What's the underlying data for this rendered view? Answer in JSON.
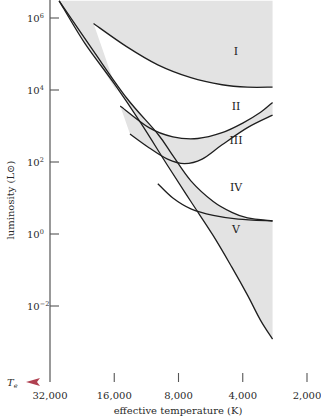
{
  "chart_data": {
    "type": "area",
    "title": "",
    "xlabel": "effective temperature (K)",
    "ylabel": "luminosity (L⊙)",
    "x_axis_symbol": "T",
    "x_axis_symbol_subscript": "e",
    "x_scale": "log",
    "x_reversed": true,
    "y_scale": "log",
    "xlim": [
      32000,
      2000
    ],
    "ylim": [
      0.001,
      10000000
    ],
    "grid": false,
    "x_ticks": [
      {
        "value": 32000,
        "label": "32,000"
      },
      {
        "value": 16000,
        "label": "16,000"
      },
      {
        "value": 8000,
        "label": "8,000"
      },
      {
        "value": 4000,
        "label": "4,000"
      },
      {
        "value": 2000,
        "label": "2,000"
      }
    ],
    "y_ticks": [
      {
        "value": 1000000,
        "base": "10",
        "exp": "6"
      },
      {
        "value": 10000,
        "base": "10",
        "exp": "4"
      },
      {
        "value": 100,
        "base": "10",
        "exp": "2"
      },
      {
        "value": 1,
        "base": "10",
        "exp": "0"
      },
      {
        "value": 0.01,
        "base": "10",
        "exp": "−2"
      }
    ],
    "x_axis_gradient": [
      "#d9667a",
      "#c9c27a",
      "#66c266",
      "#7a6a8a"
    ],
    "shaded_region": {
      "color": "#e3e3e3",
      "upper_luminosity": 3000000,
      "right_temperature": 2900
    },
    "series": [
      {
        "name": "main-sequence-upper-boundary",
        "points": [
          [
            29000,
            3000000
          ],
          [
            20000,
            120000
          ],
          [
            14000,
            6000
          ],
          [
            10000,
            600
          ],
          [
            8500,
            150
          ],
          [
            7000,
            30
          ],
          [
            5500,
            8
          ],
          [
            4500,
            4
          ],
          [
            3800,
            2.8
          ],
          [
            2900,
            2.3
          ]
        ]
      },
      {
        "name": "main-sequence-lower-boundary",
        "points": [
          [
            29000,
            3000000
          ],
          [
            22000,
            200000
          ],
          [
            16000,
            15000
          ],
          [
            12000,
            1200
          ],
          [
            9000,
            80
          ],
          [
            7000,
            8
          ],
          [
            5500,
            0.9
          ],
          [
            4500,
            0.12
          ],
          [
            3800,
            0.02
          ],
          [
            3300,
            0.004
          ],
          [
            2900,
            0.0012
          ]
        ]
      },
      {
        "name": "class-I-lower-boundary",
        "points": [
          [
            20000,
            700000
          ],
          [
            14000,
            160000
          ],
          [
            10000,
            50000
          ],
          [
            7000,
            22000
          ],
          [
            5000,
            14000
          ],
          [
            3800,
            12000
          ],
          [
            2900,
            12000
          ]
        ]
      },
      {
        "name": "class-II-lower-boundary",
        "points": [
          [
            15000,
            3600
          ],
          [
            11000,
            900
          ],
          [
            8500,
            500
          ],
          [
            6500,
            450
          ],
          [
            5000,
            650
          ],
          [
            4000,
            1200
          ],
          [
            3300,
            2400
          ],
          [
            2900,
            4500
          ]
        ]
      },
      {
        "name": "class-III-lower-boundary",
        "points": [
          [
            13500,
            600
          ],
          [
            11000,
            250
          ],
          [
            9000,
            120
          ],
          [
            7500,
            90
          ],
          [
            6200,
            120
          ],
          [
            5000,
            300
          ],
          [
            3800,
            900
          ],
          [
            2900,
            2000
          ]
        ]
      },
      {
        "name": "class-IV-lower-boundary",
        "points": [
          [
            10000,
            25
          ],
          [
            8500,
            10
          ],
          [
            7000,
            5
          ],
          [
            5500,
            3.3
          ],
          [
            4200,
            2.6
          ],
          [
            2900,
            2.3
          ]
        ]
      }
    ],
    "annotations": [
      {
        "label": "I",
        "temperature": 4300,
        "luminosity": 120000
      },
      {
        "label": "II",
        "temperature": 4300,
        "luminosity": 3600
      },
      {
        "label": "III",
        "temperature": 4300,
        "luminosity": 400
      },
      {
        "label": "IV",
        "temperature": 4300,
        "luminosity": 20
      },
      {
        "label": "V",
        "temperature": 4300,
        "luminosity": 1.4
      }
    ]
  }
}
